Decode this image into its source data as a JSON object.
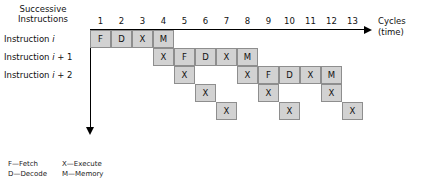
{
  "figure": {
    "header": {
      "successive_line1": "Successive",
      "successive_line2": "Instructions"
    },
    "row_labels": [
      {
        "prefix": "Instruction ",
        "var": "i",
        "suffix": ""
      },
      {
        "prefix": "Instruction ",
        "var": "i",
        "suffix": " + 1"
      },
      {
        "prefix": "Instruction ",
        "var": "i",
        "suffix": " + 2"
      }
    ],
    "x_axis": {
      "caption_line1": "Cycles",
      "caption_line2": "(time)",
      "tick_labels": [
        "1",
        "2",
        "3",
        "4",
        "5",
        "6",
        "7",
        "8",
        "9",
        "10",
        "11",
        "12",
        "13"
      ]
    },
    "colors": {
      "cell_fill": "#d2d2d2",
      "cell_border": "#8e8e8e",
      "axis": "#000000",
      "text": "#111111"
    },
    "legend": [
      {
        "code": "F",
        "dash": "—",
        "name": "Fetch"
      },
      {
        "code": "X",
        "dash": "—",
        "name": "Execute"
      },
      {
        "code": "D",
        "dash": "—",
        "name": "Decode"
      },
      {
        "code": "M",
        "dash": "—",
        "name": "Memory"
      }
    ]
  },
  "chart_data": {
    "type": "table",
    "xlabel": "Cycles (time)",
    "ylabel": "Successive Instructions",
    "columns": [
      "1",
      "2",
      "3",
      "4",
      "5",
      "6",
      "7",
      "8",
      "9",
      "10",
      "11",
      "12",
      "13"
    ],
    "stage_legend": {
      "F": "Fetch",
      "D": "Decode",
      "X": "Execute",
      "M": "Memory"
    },
    "rows": [
      {
        "label": "Instruction i",
        "row_index": 0,
        "cells": [
          {
            "cycle": 1,
            "stage": "F"
          },
          {
            "cycle": 2,
            "stage": "D"
          },
          {
            "cycle": 3,
            "stage": "X"
          },
          {
            "cycle": 4,
            "stage": "M"
          }
        ]
      },
      {
        "label": "Instruction i + 1",
        "row_index": 1,
        "cells": [
          {
            "cycle": 4,
            "stage": "X"
          },
          {
            "cycle": 5,
            "stage": "F"
          },
          {
            "cycle": 6,
            "stage": "D"
          },
          {
            "cycle": 7,
            "stage": "X"
          },
          {
            "cycle": 8,
            "stage": "M"
          }
        ]
      },
      {
        "label": "Instruction i + 2",
        "row_index": 2,
        "cells": [
          {
            "cycle": 5,
            "stage": "X"
          },
          {
            "cycle": 8,
            "stage": "X"
          },
          {
            "cycle": 9,
            "stage": "F"
          },
          {
            "cycle": 10,
            "stage": "D"
          },
          {
            "cycle": 11,
            "stage": "X"
          },
          {
            "cycle": 12,
            "stage": "M"
          }
        ]
      },
      {
        "label": "",
        "row_index": 3,
        "cells": [
          {
            "cycle": 6,
            "stage": "X"
          },
          {
            "cycle": 9,
            "stage": "X"
          },
          {
            "cycle": 12,
            "stage": "X"
          }
        ]
      },
      {
        "label": "",
        "row_index": 4,
        "cells": [
          {
            "cycle": 7,
            "stage": "X"
          },
          {
            "cycle": 10,
            "stage": "X"
          },
          {
            "cycle": 13,
            "stage": "X"
          }
        ]
      }
    ],
    "grid": false,
    "legend_position": "bottom-left"
  }
}
